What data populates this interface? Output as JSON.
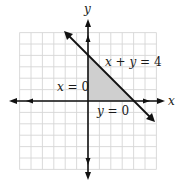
{
  "chart_data": {
    "type": "line",
    "title": "",
    "xlabel": "x",
    "ylabel": "y",
    "xlim": [
      -6,
      6
    ],
    "ylim": [
      -6,
      6
    ],
    "grid": true,
    "grid_step": 1,
    "tick_labels": false,
    "series": [
      {
        "name": "x + y = 4",
        "kind": "line",
        "points": [
          [
            -2,
            6
          ],
          [
            5.8,
            -1.8
          ]
        ],
        "arrows": "both"
      },
      {
        "name": "x = 0",
        "kind": "boundary",
        "points": [
          [
            0,
            0
          ],
          [
            0,
            4
          ]
        ]
      },
      {
        "name": "y = 0",
        "kind": "boundary",
        "points": [
          [
            0,
            0
          ],
          [
            4,
            0
          ]
        ]
      }
    ],
    "shaded_region": {
      "description": "feasible region x >= 0, y >= 0, x + y <= 4",
      "vertices": [
        [
          0,
          0
        ],
        [
          0,
          4
        ],
        [
          4,
          0
        ]
      ],
      "color": "#cfcfcf"
    },
    "annotations": [
      {
        "text": "x + y = 4",
        "at": [
          1.5,
          3.2
        ]
      },
      {
        "text": "x = 0",
        "at": [
          -2.7,
          0.9
        ]
      },
      {
        "text": "y = 0",
        "at": [
          0.8,
          -1.1
        ]
      }
    ]
  },
  "labels": {
    "x_axis": "x",
    "y_axis": "y",
    "line_eq": "x + y = 4",
    "x_zero": "x = 0",
    "y_zero": "y = 0"
  },
  "colors": {
    "grid": "#d6d6d6",
    "axis": "#111111",
    "region": "#cfcfcf"
  }
}
